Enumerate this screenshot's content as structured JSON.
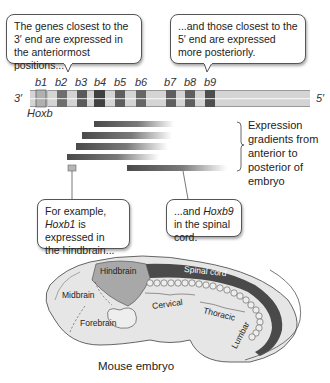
{
  "callouts": {
    "top_left": "The genes closest to the 3′ end are expressed in the anteriormost positions...",
    "top_right": "...and those closest to the 5′ end are expressed more posteriorly.",
    "bottom_left_pre": "For example, ",
    "bottom_left_gene": "Hoxb1",
    "bottom_left_post": " is expressed in the hindbrain...",
    "bottom_right_pre": "...and ",
    "bottom_right_gene": "Hoxb9",
    "bottom_right_post": " in the spinal cord."
  },
  "gene_cluster": {
    "name": "Hoxb",
    "end_left": "3′",
    "end_right": "5′",
    "genes": [
      "b1",
      "b2",
      "b3",
      "b4",
      "b5",
      "b6",
      "b7",
      "b8",
      "b9"
    ]
  },
  "expression_label": "Expression gradients from anterior to posterior of embryo",
  "embryo": {
    "caption": "Mouse embryo",
    "regions": {
      "hindbrain": "Hindbrain",
      "midbrain": "Midbrain",
      "forebrain": "Forebrain",
      "spinal_cord": "Spinal cord",
      "cervical": "Cervical",
      "thoracic": "Thoracic",
      "lumbar": "Lumbar"
    }
  },
  "colors": {
    "gene_light": "#c9c9c9",
    "gene_dark": "#555555",
    "bar_bg": "#d8d8d8",
    "embryo_fill": "#e6e6e6",
    "hindbrain_fill": "#a8a8a8",
    "spinal_fill": "#4a4a4a"
  }
}
